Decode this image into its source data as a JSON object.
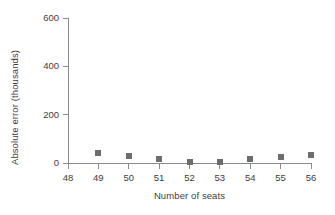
{
  "chart_data": {
    "type": "scatter",
    "title": "",
    "xlabel": "Number of seats",
    "ylabel": "Absolute error (thousands)",
    "x": [
      49,
      50,
      51,
      52,
      53,
      54,
      55,
      56
    ],
    "values": [
      40,
      28,
      16,
      4,
      4,
      16,
      24,
      32
    ],
    "series": [
      {
        "name": "Absolute error",
        "x": [
          49,
          50,
          51,
          52,
          53,
          54,
          55,
          56
        ],
        "values": [
          40,
          28,
          16,
          4,
          4,
          16,
          24,
          32
        ]
      }
    ],
    "xlim": [
      48,
      56
    ],
    "ylim": [
      0,
      600
    ],
    "xticks": [
      48,
      49,
      50,
      51,
      52,
      53,
      54,
      55,
      56
    ],
    "xticklabels": [
      "48",
      "49",
      "50",
      "51",
      "52",
      "53",
      "54",
      "55",
      "56"
    ],
    "yticks": [
      0,
      200,
      400,
      600
    ],
    "yticklabels": [
      "0",
      "200",
      "400",
      "600"
    ],
    "grid": false,
    "legend": null,
    "legend_position": "none",
    "marker": "square",
    "colors": {
      "marker": "#6d6d6d",
      "axis": "#8a8a8a",
      "text": "#3d3d3d",
      "background": "#ffffff"
    }
  }
}
